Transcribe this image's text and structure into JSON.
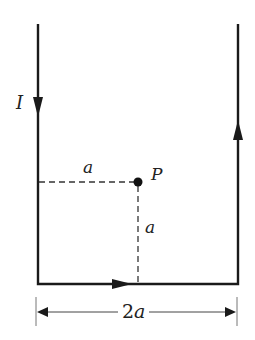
{
  "labels": {
    "current": "I",
    "point": "P",
    "horizontal_distance": "a",
    "vertical_distance": "a",
    "width_coefficient": "2",
    "width_variable": "a"
  },
  "colors": {
    "wire": "#1a1a1a",
    "dashed": "#333333",
    "dimension": "#444444",
    "text": "#222222",
    "background": "#ffffff"
  },
  "geometry": {
    "left_wire_x": 38,
    "right_wire_x": 238,
    "wire_top_y": 24,
    "bottom_wire_y": 284,
    "point_p": [
      138,
      182
    ],
    "dimension_line_y": 312
  }
}
